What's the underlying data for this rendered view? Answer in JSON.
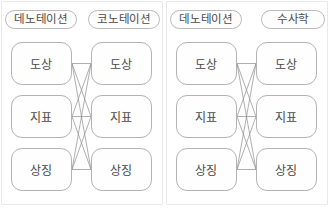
{
  "figure": {
    "type": "bipartite-mapping-diagram-pair",
    "panels": [
      {
        "id": "panel-left",
        "headers": {
          "left_label": "데노테이션",
          "right_label": "코노테이션"
        },
        "left_nodes": [
          "도상",
          "지표",
          "상징"
        ],
        "right_nodes": [
          "도상",
          "지표",
          "상징"
        ],
        "edges": [
          [
            0,
            0
          ],
          [
            0,
            1
          ],
          [
            0,
            2
          ],
          [
            1,
            0
          ],
          [
            1,
            1
          ],
          [
            1,
            2
          ],
          [
            2,
            0
          ],
          [
            2,
            1
          ],
          [
            2,
            2
          ]
        ]
      },
      {
        "id": "panel-right",
        "headers": {
          "left_label": "데노테이션",
          "right_label": "수사학"
        },
        "left_nodes": [
          "도상",
          "지표",
          "상징"
        ],
        "right_nodes": [
          "도상",
          "지표",
          "상징"
        ],
        "edges": [
          [
            0,
            0
          ],
          [
            0,
            1
          ],
          [
            0,
            2
          ],
          [
            1,
            0
          ],
          [
            1,
            1
          ],
          [
            1,
            2
          ],
          [
            2,
            0
          ],
          [
            2,
            1
          ],
          [
            2,
            2
          ]
        ]
      }
    ],
    "colors": {
      "node_border": "#b3b3b3",
      "pill_border": "#b9b9b9",
      "edge_line": "#8c8c8c",
      "panel_border": "#e9e9e9",
      "text": "#4a4a4a",
      "background": "#ffffff"
    }
  }
}
